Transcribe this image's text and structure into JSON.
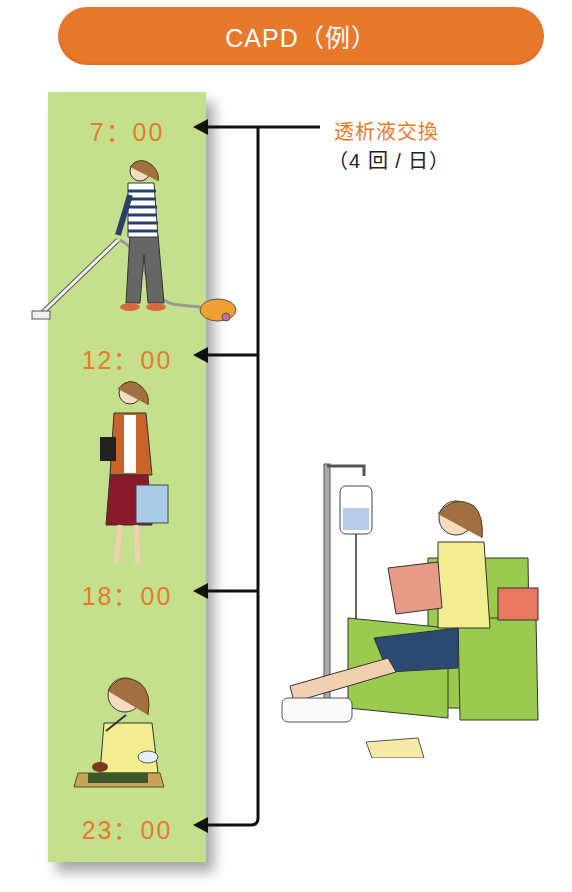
{
  "title": "CAPD（例）",
  "exchange_label": {
    "main": "透析液交換",
    "sub": "（4 回 / 日）"
  },
  "schedule": [
    {
      "time": "7：00",
      "activity": "vacuuming"
    },
    {
      "time": "12：00",
      "activity": "shopping"
    },
    {
      "time": "18：00",
      "activity": "eating"
    },
    {
      "time": "23：00",
      "activity": "bedtime"
    }
  ],
  "illustrations": {
    "morning": "woman-vacuuming",
    "afternoon": "woman-shopping",
    "evening": "woman-eating-meal",
    "exchange_scene": "woman-reading-in-armchair-with-dialysis-bag"
  },
  "colors": {
    "title_bg": "#e8782a",
    "panel_bg": "#c5e08c",
    "time_text": "#e57a2c",
    "armchair": "#9bcb4e"
  }
}
